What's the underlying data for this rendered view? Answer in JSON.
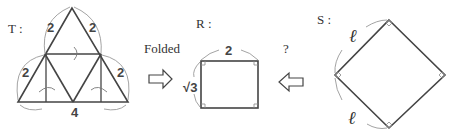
{
  "figure": {
    "shapes": {
      "T": {
        "label": "T :",
        "side_labels": [
          "2",
          "2",
          "2",
          "2"
        ],
        "base_label": "4"
      },
      "R": {
        "label": "R :",
        "top_label": "2",
        "side_label": "√3"
      },
      "S": {
        "label": "S :",
        "side_labels": [
          "ℓ",
          "ℓ"
        ]
      }
    },
    "folded_label": "Folded",
    "question_label": "?",
    "arrows": [
      {
        "from": "T",
        "to": "R",
        "direction": "right"
      },
      {
        "from": "S",
        "to": "R",
        "direction": "left"
      }
    ]
  }
}
